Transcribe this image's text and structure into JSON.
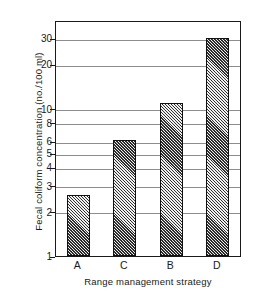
{
  "chart_data": {
    "type": "bar",
    "title": "",
    "xlabel": "Range management strategy",
    "ylabel": "Fecal coliform concentration (no./100 ml)",
    "categories": [
      "A",
      "C",
      "B",
      "D"
    ],
    "values": [
      2.6,
      6.1,
      11,
      30
    ],
    "yscale": "log",
    "ylim": [
      1,
      40
    ],
    "ytick_labels": [
      "1",
      "2",
      "3",
      "4",
      "5",
      "6",
      "8",
      "10",
      "20",
      "30"
    ],
    "ytick_values": [
      1,
      2,
      3,
      4,
      5,
      6,
      8,
      10,
      20,
      30
    ],
    "grid": "horizontal",
    "legend": "none",
    "bar_fill": "diagonal-crosshatch",
    "axis_color": "#1a1a1a",
    "grid_color": "#8d8d8d",
    "bar_edge_color": "#111111"
  }
}
